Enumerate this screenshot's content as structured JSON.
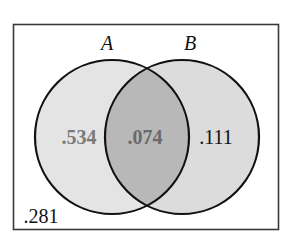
{
  "diagram": {
    "type": "venn",
    "sets": [
      {
        "label": "A"
      },
      {
        "label": "B"
      }
    ],
    "regions": {
      "a_only": ".534",
      "a_and_b": ".074",
      "b_only": ".111",
      "neither": ".281"
    },
    "colors": {
      "frame": "#3a3a3a",
      "circle_stroke": "#111111",
      "a_fill": "#e4e4e4",
      "b_fill": "#dcdcdc",
      "intersection_fill": "#b8b8b8",
      "a_only_text": "#7a7a7a",
      "intersection_text": "#6a6a6a",
      "b_only_text": "#111111",
      "neither_text": "#111111"
    }
  }
}
